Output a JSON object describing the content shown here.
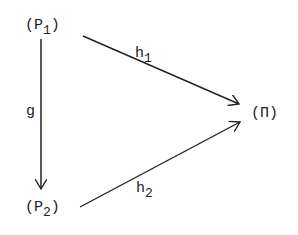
{
  "diagram": {
    "nodes": {
      "p1": {
        "open": "(P",
        "sub": "1",
        "close": ")"
      },
      "p2": {
        "open": "(P",
        "sub": "2",
        "close": ")"
      },
      "pi": {
        "label": "(Π)"
      }
    },
    "edges": {
      "g": {
        "label": "g",
        "from": "P1",
        "to": "P2"
      },
      "h1": {
        "label": "h",
        "sub": "1",
        "from": "P1",
        "to": "Π"
      },
      "h2": {
        "label": "h",
        "sub": "2",
        "from": "P2",
        "to": "Π"
      }
    },
    "colors": {
      "ink": "#222222",
      "background": "#ffffff"
    }
  }
}
